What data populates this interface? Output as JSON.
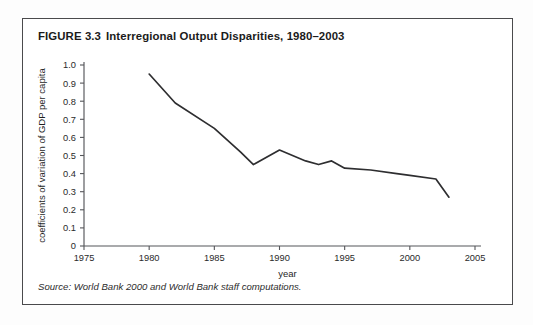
{
  "figure": {
    "number": "FIGURE 3.3",
    "title": "Interregional Output Disparities, 1980–2003",
    "source": "Source: World Bank 2000 and World Bank staff computations."
  },
  "chart_data": {
    "type": "line",
    "title": "Interregional Output Disparities, 1980–2003",
    "xlabel": "year",
    "ylabel": "coefficients of variation of GDP per capita",
    "xlim": [
      1975,
      2005
    ],
    "ylim": [
      0,
      1.0
    ],
    "xticks": [
      1975,
      1980,
      1985,
      1990,
      1995,
      2000,
      2005
    ],
    "xtick_labels": [
      "1975",
      "1980",
      "1985",
      "1990",
      "1995",
      "2000",
      "2005"
    ],
    "yticks": [
      0,
      0.1,
      0.2,
      0.3,
      0.4,
      0.5,
      0.6,
      0.7,
      0.8,
      0.9,
      1.0
    ],
    "ytick_labels": [
      "0",
      "0.1",
      "0.2",
      "0.3",
      "0.4",
      "0.5",
      "0.6",
      "0.7",
      "0.8",
      "0.9",
      "1.0"
    ],
    "grid": false,
    "legend": false,
    "line_color": "#2e2e30",
    "x": [
      1980,
      1982,
      1985,
      1987,
      1988,
      1990,
      1992,
      1993,
      1994,
      1995,
      1997,
      1999,
      2000,
      2002,
      2003
    ],
    "y": [
      0.95,
      0.79,
      0.65,
      0.52,
      0.45,
      0.53,
      0.47,
      0.45,
      0.47,
      0.43,
      0.42,
      0.4,
      0.39,
      0.37,
      0.27
    ],
    "series": [
      {
        "name": "coefficient of variation of GDP per capita",
        "values": [
          0.95,
          0.79,
          0.65,
          0.52,
          0.45,
          0.53,
          0.47,
          0.45,
          0.47,
          0.43,
          0.42,
          0.4,
          0.39,
          0.37,
          0.27
        ]
      }
    ]
  }
}
